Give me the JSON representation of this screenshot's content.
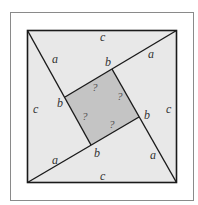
{
  "diagram": {
    "colors": {
      "background": "#ffffff",
      "frame": "#8a8a8a",
      "outer_fill": "#e8e8e8",
      "inner_fill": "#c4c4c4",
      "line": "#1a1a1a"
    },
    "labels": {
      "c_top": "c",
      "c_left": "c",
      "c_right": "c",
      "c_bottom": "c",
      "a_topleft": "a",
      "a_topright": "a",
      "a_bottomleft": "a",
      "a_bottomright": "a",
      "b_top": "b",
      "b_left": "b",
      "b_right": "b",
      "b_bottom": "b",
      "q1": "?",
      "q2": "?",
      "q3": "?",
      "q4": "?"
    }
  }
}
